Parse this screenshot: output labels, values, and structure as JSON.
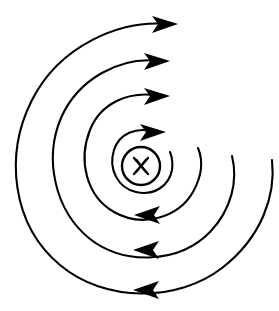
{
  "figure": {
    "title": "Magnetic field lines around a current-carrying conductor",
    "background_color": "#ffffff",
    "line_color": "#000000",
    "stroke_width": 2
  },
  "wire": {
    "symbol": "X",
    "meaning": "current into the page",
    "center_x": 141,
    "center_y": 166,
    "radius": 19
  },
  "field_lines": [
    {
      "id": "field-line-1",
      "order": 1,
      "label": "innermost field line",
      "radius": 24,
      "center_x": 141,
      "center_y": 166,
      "arrow_direction": "right",
      "rotation_sense": "clockwise",
      "arrow_x": 156,
      "arrow_y": 131
    },
    {
      "id": "field-line-2",
      "order": 2,
      "label": "second field line",
      "radius": 53,
      "center_x": 143,
      "center_y": 166,
      "arrow_direction": "right",
      "rotation_sense": "clockwise",
      "arrow_x": 160,
      "arrow_y": 95
    },
    {
      "id": "field-line-3",
      "order": 3,
      "label": "third field line",
      "radius": 86,
      "center_x": 143,
      "center_y": 167,
      "arrow_direction": "right",
      "rotation_sense": "clockwise",
      "arrow_x": 160,
      "arrow_y": 60
    },
    {
      "id": "field-line-4",
      "order": 4,
      "label": "outermost field line",
      "radius": 126,
      "center_x": 146,
      "center_y": 168,
      "arrow_direction": "right",
      "rotation_sense": "clockwise",
      "arrow_x": 170,
      "arrow_y": 23
    }
  ],
  "return_arrows": [
    {
      "id": "return-arrow-1",
      "label": "inner lower arrow",
      "x": 147,
      "y": 214,
      "direction": "left"
    },
    {
      "id": "return-arrow-2",
      "label": "middle lower arrow",
      "x": 146,
      "y": 249,
      "direction": "left"
    },
    {
      "id": "return-arrow-3",
      "label": "outer lower arrow",
      "x": 146,
      "y": 289,
      "direction": "left"
    }
  ]
}
